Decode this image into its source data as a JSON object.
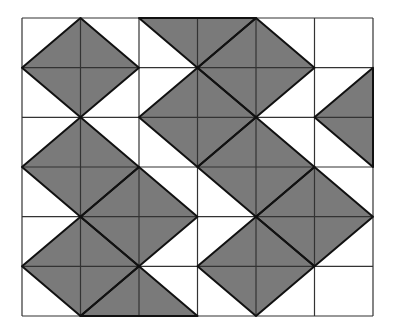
{
  "diagram": {
    "type": "tessellation-grid",
    "grid": {
      "columns": 6,
      "rows": 6,
      "origin_px": [
        22,
        18
      ],
      "cell_w": 58.5,
      "cell_h": 49.67
    },
    "colors": {
      "background": "#ffffff",
      "fill": "#7a7a7a",
      "grid_line": "#333333",
      "shape_edge": "#111111"
    },
    "shaded_polygons": [
      {
        "name": "diamond-1",
        "points": [
          [
            1,
            0
          ],
          [
            2,
            1
          ],
          [
            1,
            2
          ],
          [
            0,
            1
          ]
        ]
      },
      {
        "name": "triangle-top",
        "points": [
          [
            2,
            0
          ],
          [
            4,
            0
          ],
          [
            3,
            1
          ]
        ]
      },
      {
        "name": "diamond-2",
        "points": [
          [
            4,
            0
          ],
          [
            5,
            1
          ],
          [
            4,
            2
          ],
          [
            3,
            1
          ]
        ]
      },
      {
        "name": "diamond-3",
        "points": [
          [
            3,
            1
          ],
          [
            4,
            2
          ],
          [
            3,
            3
          ],
          [
            2,
            2
          ]
        ]
      },
      {
        "name": "triangle-right",
        "points": [
          [
            6,
            1
          ],
          [
            5,
            2
          ],
          [
            6,
            3
          ]
        ]
      },
      {
        "name": "diamond-4",
        "points": [
          [
            1,
            2
          ],
          [
            2,
            3
          ],
          [
            1,
            4
          ],
          [
            0,
            3
          ]
        ]
      },
      {
        "name": "diamond-5",
        "points": [
          [
            4,
            2
          ],
          [
            5,
            3
          ],
          [
            4,
            4
          ],
          [
            3,
            3
          ]
        ]
      },
      {
        "name": "diamond-6",
        "points": [
          [
            2,
            3
          ],
          [
            3,
            4
          ],
          [
            2,
            5
          ],
          [
            1,
            4
          ]
        ]
      },
      {
        "name": "diamond-7",
        "points": [
          [
            5,
            3
          ],
          [
            6,
            4
          ],
          [
            5,
            5
          ],
          [
            4,
            4
          ]
        ]
      },
      {
        "name": "diamond-8",
        "points": [
          [
            1,
            4
          ],
          [
            2,
            5
          ],
          [
            1,
            6
          ],
          [
            0,
            5
          ]
        ]
      },
      {
        "name": "diamond-9",
        "points": [
          [
            4,
            4
          ],
          [
            5,
            5
          ],
          [
            4,
            6
          ],
          [
            3,
            5
          ]
        ]
      },
      {
        "name": "triangle-bottom",
        "points": [
          [
            1,
            6
          ],
          [
            3,
            6
          ],
          [
            2,
            5
          ]
        ]
      }
    ]
  }
}
